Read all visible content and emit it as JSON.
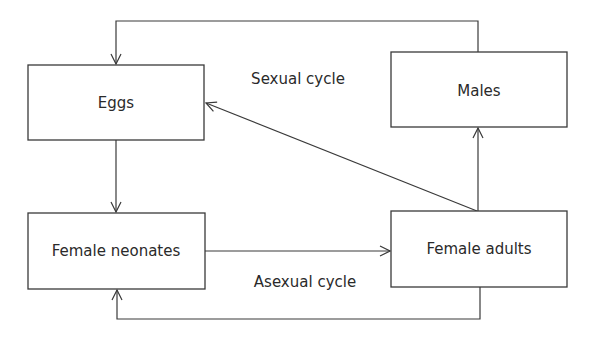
{
  "diagram": {
    "title": "",
    "nodes": {
      "eggs": {
        "label": "Eggs"
      },
      "males": {
        "label": "Males"
      },
      "female_neonates": {
        "label": "Female neonates"
      },
      "female_adults": {
        "label": "Female adults"
      }
    },
    "cycle_labels": {
      "sexual": "Sexual cycle",
      "asexual": "Asexual cycle"
    },
    "edges": [
      {
        "from": "males",
        "to": "eggs",
        "cycle": "sexual",
        "route": "top loop"
      },
      {
        "from": "eggs",
        "to": "female_neonates",
        "cycle": "shared"
      },
      {
        "from": "female_neonates",
        "to": "female_adults",
        "cycle": "shared"
      },
      {
        "from": "female_adults",
        "to": "males",
        "cycle": "sexual"
      },
      {
        "from": "female_adults",
        "to": "eggs",
        "cycle": "sexual",
        "route": "diagonal"
      },
      {
        "from": "female_adults",
        "to": "female_neonates",
        "cycle": "asexual",
        "route": "bottom loop"
      }
    ],
    "colors": {
      "stroke": "#3a3a3a",
      "text": "#2a2a2a",
      "background": "#ffffff"
    }
  }
}
